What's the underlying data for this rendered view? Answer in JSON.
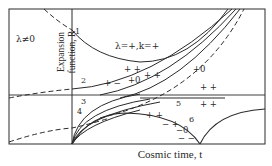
{
  "diagram": {
    "title": "",
    "x_axis_label": "Cosmic time, t",
    "y_axis_label_line1": "Expansion",
    "y_axis_label_line2": "function, R",
    "region_label": "λ≠0",
    "curve_annotation": "λ=+,k=+",
    "curve_numbers": [
      "1",
      "2",
      "3",
      "4",
      "5",
      "6"
    ],
    "sign_labels": {
      "near_2_upper": "+ +",
      "near_2_lower_left": "+ −",
      "near_2_lower_mid": "+0",
      "near_2_lower_right": "+ +",
      "dashed_upper": "+0",
      "above_5": "+ +",
      "below_5": "+ +",
      "left_of_6": "+ +",
      "minus_plus": "− +",
      "minus_zero": "−0",
      "minus_minus": "− −"
    },
    "colors": {
      "line": "#2a2a2a",
      "background": "#ffffff"
    }
  }
}
